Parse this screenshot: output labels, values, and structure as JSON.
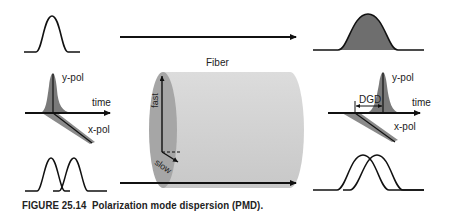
{
  "diagram": {
    "title": "Polarization mode dispersion",
    "fiber_label": "Fiber",
    "input_pulse_3d": {
      "y_label": "y-pol",
      "x_label": "x-pol",
      "axis_label": "time"
    },
    "output_pulse_3d": {
      "y_label": "y-pol",
      "x_label": "x-pol",
      "axis_label": "time",
      "delay_label": "DGD"
    },
    "fiber_axes": {
      "fast_label": "fast",
      "slow_label": "slow"
    },
    "colors": {
      "line": "#111111",
      "pulse_fill": "#6e6e6e",
      "fiber_body": "#d4d4d4",
      "fiber_end": "#a8a8a8"
    }
  },
  "caption": {
    "figure_number": "FIGURE 25.14",
    "text": "Polarization mode dispersion (PMD)."
  }
}
